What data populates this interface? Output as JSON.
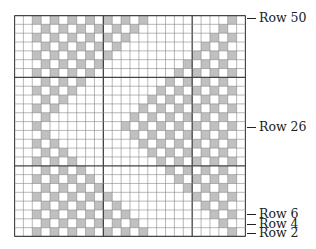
{
  "chart_data": {
    "type": "table",
    "columns": 26,
    "rows": 25,
    "row_numbering": "even rows, bottom row = Row 2, top row = Row 50",
    "cell_color_filled": "#c0c0c0",
    "cell_color_empty": "#ffffff",
    "grid_color": "#888888",
    "major_grid_color": "#444444",
    "major_grid_every": 10,
    "major_vertical_after_cols": [
      10,
      20
    ],
    "major_horizontal_after_rows_from_top": [
      7,
      17
    ],
    "filled_cells_by_row_from_top": [
      [
        3,
        5,
        7,
        9,
        11,
        13,
        15,
        25
      ],
      [
        4,
        6,
        8,
        10,
        12,
        14,
        24
      ],
      [
        3,
        5,
        7,
        9,
        11,
        13,
        23,
        25
      ],
      [
        4,
        6,
        8,
        10,
        12,
        22,
        24
      ],
      [
        3,
        5,
        7,
        9,
        11,
        21,
        23,
        25
      ],
      [
        4,
        6,
        8,
        10,
        20,
        22,
        24
      ],
      [
        3,
        5,
        7,
        9,
        19,
        21,
        23,
        25
      ],
      [
        4,
        6,
        8,
        18,
        20,
        22,
        24
      ],
      [
        3,
        5,
        7,
        17,
        19,
        21,
        23,
        25
      ],
      [
        4,
        6,
        16,
        18,
        20,
        22,
        24
      ],
      [
        3,
        5,
        15,
        17,
        19,
        21,
        23,
        25
      ],
      [
        4,
        14,
        16,
        18,
        20,
        22,
        24
      ],
      [
        3,
        13,
        15,
        17,
        19,
        21,
        23,
        25
      ],
      [
        4,
        14,
        16,
        18,
        20,
        22,
        24
      ],
      [
        3,
        5,
        15,
        17,
        19,
        21,
        23,
        25
      ],
      [
        4,
        6,
        16,
        18,
        20,
        22,
        24
      ],
      [
        3,
        5,
        7,
        17,
        19,
        21,
        23,
        25
      ],
      [
        4,
        6,
        8,
        18,
        20,
        22,
        24
      ],
      [
        3,
        5,
        7,
        9,
        19,
        21,
        23,
        25
      ],
      [
        4,
        6,
        8,
        10,
        20,
        22,
        24
      ],
      [
        3,
        5,
        7,
        9,
        11,
        21,
        23,
        25
      ],
      [
        4,
        6,
        8,
        10,
        12,
        22,
        24
      ],
      [
        3,
        5,
        7,
        9,
        11,
        13,
        23,
        25
      ],
      [
        4,
        6,
        8,
        10,
        12,
        14,
        24
      ],
      [
        3,
        5,
        7,
        9,
        11,
        13,
        15,
        25
      ]
    ]
  },
  "labels": [
    {
      "text": "Row 50",
      "y": 18
    },
    {
      "text": "Row 26",
      "y": 127
    },
    {
      "text": "Row 6",
      "y": 214
    },
    {
      "text": "Row 4",
      "y": 224
    },
    {
      "text": "Row 2",
      "y": 233
    }
  ]
}
